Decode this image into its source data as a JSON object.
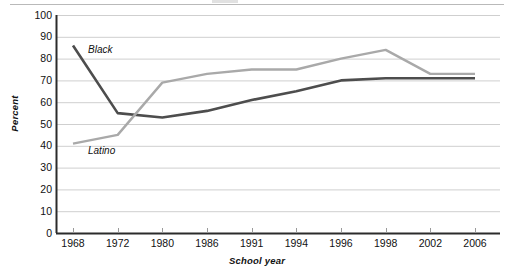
{
  "chart_data": {
    "type": "line",
    "title": "",
    "xlabel": "School year",
    "ylabel": "Percent",
    "categories": [
      "1968",
      "1972",
      "1980",
      "1986",
      "1991",
      "1994",
      "1996",
      "1998",
      "2002",
      "2006"
    ],
    "ylim": [
      0,
      100
    ],
    "ytick_labels": [
      "0",
      "10",
      "20",
      "30",
      "40",
      "50",
      "60",
      "70",
      "80",
      "90",
      "100"
    ],
    "ytick_values": [
      0,
      10,
      20,
      30,
      40,
      50,
      60,
      70,
      80,
      90,
      100
    ],
    "grid": true,
    "legend_position": "inline-labels",
    "series": [
      {
        "name": "Black",
        "color": "#4d4d4d",
        "values": [
          86,
          55,
          53,
          56,
          61,
          65,
          70,
          71,
          71,
          71
        ]
      },
      {
        "name": "Latino",
        "color": "#a9a9a9",
        "values": [
          41,
          45,
          69,
          73,
          75,
          75,
          80,
          84,
          73,
          73
        ]
      }
    ]
  },
  "axes": {
    "y_title": "Percent",
    "x_title": "School year"
  },
  "colors": {
    "black_series": "#4d4d4d",
    "latino_series": "#a9a9a9",
    "gridline": "#cfcfcf",
    "axis": "#2b2b2b",
    "top_rule": "#b9b9b9",
    "background": "#ffffff"
  }
}
